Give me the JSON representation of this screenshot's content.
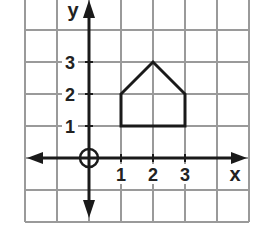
{
  "diagram": {
    "type": "coordinate-grid",
    "grid": {
      "x_min": -2,
      "x_max": 5,
      "y_min": -2,
      "y_max": 5,
      "cell_px": 32,
      "origin_px": [
        89,
        158
      ],
      "line_color": "#9a9a9a"
    },
    "axes": {
      "x_label": "x",
      "y_label": "y",
      "color": "#1a1a1a",
      "x_ticks": [
        {
          "value": 1,
          "label": "1"
        },
        {
          "value": 2,
          "label": "2"
        },
        {
          "value": 3,
          "label": "3"
        }
      ],
      "y_ticks": [
        {
          "value": 1,
          "label": "1"
        },
        {
          "value": 2,
          "label": "2"
        },
        {
          "value": 3,
          "label": "3"
        }
      ],
      "origin_marker": "circle"
    },
    "shape": {
      "name": "pentagon",
      "vertices": [
        [
          1,
          1
        ],
        [
          1,
          2
        ],
        [
          2,
          3
        ],
        [
          3,
          2
        ],
        [
          3,
          1
        ]
      ],
      "stroke": "#1a1a1a"
    }
  }
}
